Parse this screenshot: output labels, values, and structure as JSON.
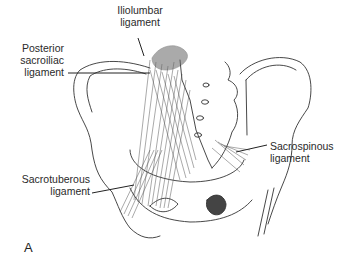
{
  "figure": {
    "panel_letter": "A",
    "labels": {
      "iliolumbar": {
        "line1": "Iliolumbar",
        "line2": "ligament"
      },
      "posterior_sacroiliac": {
        "line1": "Posterior",
        "line2": "sacroiliac",
        "line3": "ligament"
      },
      "sacrospinous": {
        "line1": "Sacrospinous",
        "line2": "ligament"
      },
      "sacrotuberous": {
        "line1": "Sacrotuberous",
        "line2": "ligament"
      }
    }
  }
}
